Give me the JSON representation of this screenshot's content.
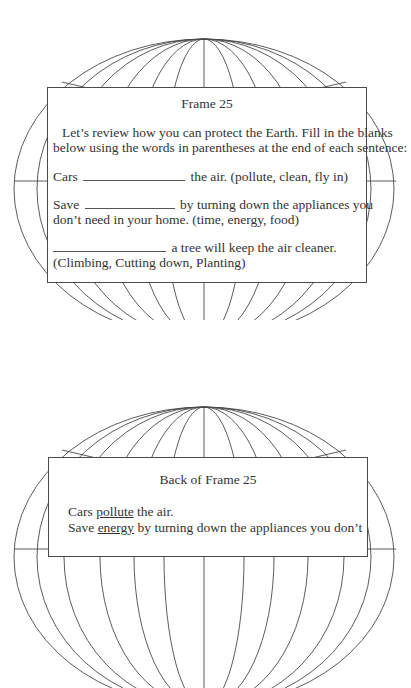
{
  "front": {
    "title": "Frame 25",
    "intro_line1": "Let’s review how you can protect the Earth. Fill in the blanks",
    "intro_line2": "below using the words in parentheses at the end of each sentence:",
    "q1": {
      "before": "Cars",
      "after": "the air. (pollute, clean, fly in)"
    },
    "q2": {
      "before": "Save",
      "after": "by turning down the appliances you",
      "line2": "don’t need in your home. (time, energy, food)"
    },
    "q3": {
      "after": "a tree will keep the air cleaner.",
      "line2": "(Climbing, Cutting down, Planting)"
    }
  },
  "back": {
    "title": "Back of Frame 25",
    "a1": {
      "before": "Cars",
      "answer": "pollute",
      "after": "the air."
    },
    "a2": {
      "before": "Save",
      "answer": "energy",
      "after": "by turning down the appliances you don’t"
    }
  },
  "graphics": {
    "globe_icon": "globe-wireframe",
    "line_color": "#4a4a4a"
  }
}
